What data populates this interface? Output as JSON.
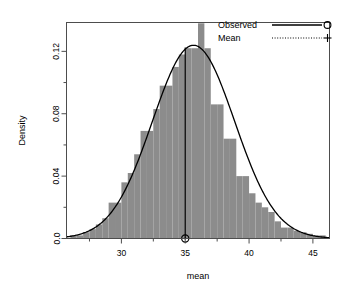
{
  "chart_data": {
    "type": "bar",
    "title": "",
    "xlabel": "mean",
    "ylabel": "Density",
    "xlim": [
      25.7,
      46.3
    ],
    "ylim": [
      0.0,
      0.1385
    ],
    "grid": false,
    "legend_position": "top-right",
    "xticks": [
      30,
      35,
      40,
      45
    ],
    "xtick_labels": [
      "30",
      "35",
      "40",
      "45"
    ],
    "xminor_ticks": [
      27.5,
      32.5,
      37.5,
      42.5
    ],
    "yticks": [
      0.0,
      0.04,
      0.08,
      0.12
    ],
    "ytick_labels": [
      "0.0",
      "0.04",
      "0.08",
      "0.12"
    ],
    "yminor_ticks": [
      0.02,
      0.06,
      0.1,
      0.14
    ],
    "bar_color": "#8c8c8c",
    "line_color": "#000000",
    "bin_width": 0.5,
    "bin_starts": [
      26.0,
      26.5,
      27.0,
      27.5,
      28.0,
      28.5,
      29.0,
      29.5,
      30.0,
      30.5,
      31.0,
      31.5,
      32.0,
      32.5,
      33.0,
      33.5,
      34.0,
      34.5,
      35.0,
      35.5,
      36.0,
      36.5,
      37.0,
      37.5,
      38.0,
      38.5,
      39.0,
      39.5,
      40.0,
      40.5,
      41.0,
      41.5,
      42.0,
      42.5,
      43.0,
      43.5,
      44.0,
      44.5,
      45.0,
      45.5
    ],
    "bin_heights": [
      0.002,
      0.002,
      0.004,
      0.006,
      0.009,
      0.013,
      0.023,
      0.023,
      0.036,
      0.042,
      0.054,
      0.069,
      0.069,
      0.083,
      0.098,
      0.098,
      0.11,
      0.118,
      0.122,
      0.122,
      0.138,
      0.122,
      0.086,
      0.086,
      0.064,
      0.064,
      0.04,
      0.04,
      0.029,
      0.023,
      0.02,
      0.017,
      0.011,
      0.007,
      0.007,
      0.005,
      0.004,
      0.003,
      0.002,
      0.002
    ],
    "curve": {
      "name": "Observed",
      "type": "normal-density",
      "mean": 35.65,
      "sd": 3.22,
      "peak_density": 0.1239
    },
    "mean_line": {
      "name": "Mean",
      "x": 35.0,
      "y_top": 0.1225,
      "marker": "circle",
      "marker_y": 0.0
    },
    "legend": [
      {
        "label": "Observed",
        "line_style": "solid",
        "marker": "circle"
      },
      {
        "label": "Mean",
        "line_style": "dotted",
        "marker": "plus"
      }
    ]
  }
}
